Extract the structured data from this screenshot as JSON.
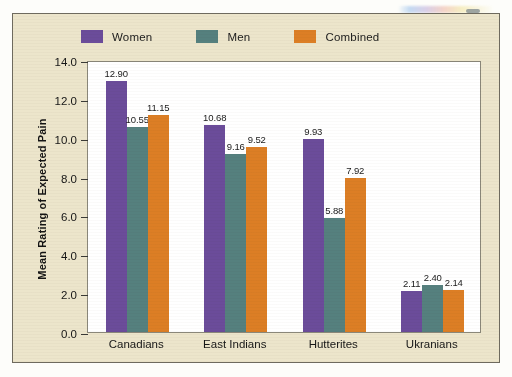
{
  "figure": {
    "panel_color": "#ECE5CB",
    "plot_background": "#FFFFFF",
    "border_color": "#6E6A5E"
  },
  "legend": {
    "position": "top-left",
    "items": [
      {
        "label": "Women",
        "color": "#6B4C9A",
        "swatch_name": "legend-swatch-women"
      },
      {
        "label": "Men",
        "color": "#55807E",
        "swatch_name": "legend-swatch-men"
      },
      {
        "label": "Combined",
        "color": "#DC7E25",
        "swatch_name": "legend-swatch-combined"
      }
    ]
  },
  "axes": {
    "y_title": "Mean Rating of Expected Pain",
    "y_ticks": [
      "0.0",
      "2.0",
      "4.0",
      "6.0",
      "8.0",
      "10.0",
      "12.0",
      "14.0"
    ],
    "y_min": 0.0,
    "y_max": 14.0,
    "y_step": 2.0,
    "x_title": ""
  },
  "chart_data": {
    "type": "bar",
    "title": "",
    "xlabel": "",
    "ylabel": "Mean Rating of Expected Pain",
    "ylim": [
      0.0,
      14.0
    ],
    "ytick_step": 2.0,
    "grid": false,
    "legend_position": "top-left",
    "categories": [
      "Canadians",
      "East Indians",
      "Hutterites",
      "Ukranians"
    ],
    "series": [
      {
        "name": "Women",
        "color": "#6B4C9A",
        "values": [
          12.9,
          10.68,
          9.93,
          2.11
        ],
        "labels": [
          "12.90",
          "10.68",
          "9.93",
          "2.11"
        ]
      },
      {
        "name": "Men",
        "color": "#55807E",
        "values": [
          10.55,
          9.16,
          5.88,
          2.4
        ],
        "labels": [
          "10.55",
          "9.16",
          "5.88",
          "2.40"
        ]
      },
      {
        "name": "Combined",
        "color": "#DC7E25",
        "values": [
          11.15,
          9.52,
          7.92,
          2.14
        ],
        "labels": [
          "11.15",
          "9.52",
          "7.92",
          "2.14"
        ]
      }
    ]
  }
}
